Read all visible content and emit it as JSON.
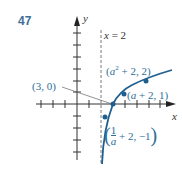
{
  "problem_number": "47",
  "axes": {
    "x_label": "x",
    "y_label": "y"
  },
  "asymptote_label": "x = 2",
  "points": [
    {
      "label": "(3, 0)",
      "x": 3,
      "y": 0
    },
    {
      "label_main": "(a",
      "label_sup": "2",
      "label_rest": " + 2, 2)",
      "x": "a^2+2",
      "y": 2
    },
    {
      "label": "(a + 2, 1)",
      "x": "a+2",
      "y": 1
    },
    {
      "label_frac_num": "1",
      "label_frac_den": "a",
      "label_rest": " + 2, −1",
      "x": "1/a+2",
      "y": -1
    }
  ],
  "colors": {
    "curve": "#1f5f8f",
    "point": "#1f5f8f",
    "label": "#2e6e99",
    "axis": "#333333",
    "number": "#3d6f96"
  }
}
